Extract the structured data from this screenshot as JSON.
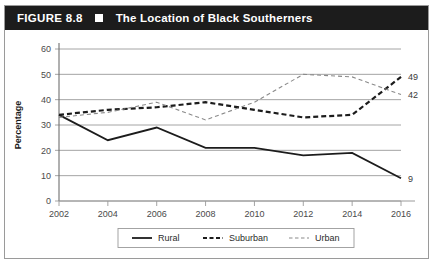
{
  "figure": {
    "number": "FIGURE 8.8",
    "bullet": "square-marker",
    "title": "The Location of Black Southerners"
  },
  "chart_data": {
    "type": "line",
    "title": "The Location of Black Southerners",
    "xlabel": "",
    "ylabel": "Percentage",
    "x": [
      2002,
      2004,
      2006,
      2008,
      2010,
      2012,
      2014,
      2016
    ],
    "xtick_labels": [
      "2002",
      "2004",
      "2006",
      "2008",
      "2010",
      "2012",
      "2014",
      "2016"
    ],
    "ytick_labels": [
      "0",
      "10",
      "20",
      "30",
      "40",
      "50",
      "60"
    ],
    "yticks": [
      0,
      10,
      20,
      30,
      40,
      50,
      60
    ],
    "ylim": [
      0,
      60
    ],
    "xlim": [
      2002,
      2016
    ],
    "grid": "horizontal",
    "legend_position": "bottom",
    "series": [
      {
        "name": "Rural",
        "style": "solid",
        "color": "#1c1c1c",
        "values": [
          34,
          24,
          29,
          21,
          21,
          18,
          19,
          9
        ],
        "end_label": "9"
      },
      {
        "name": "Suburban",
        "style": "dashed-bold",
        "color": "#1c1c1c",
        "values": [
          34,
          36,
          37,
          39,
          36,
          33,
          34,
          49
        ],
        "end_label": "49"
      },
      {
        "name": "Urban",
        "style": "dashed-light",
        "color": "#8a8a8a",
        "values": [
          33,
          35,
          39,
          32,
          39,
          50,
          49,
          42
        ],
        "end_label": "42"
      }
    ],
    "annotations": [
      {
        "text": "49",
        "series": "Suburban",
        "x": 2016
      },
      {
        "text": "42",
        "series": "Urban",
        "x": 2016
      },
      {
        "text": "9",
        "series": "Rural",
        "x": 2016
      }
    ],
    "legend": [
      {
        "label": "Rural",
        "style": "solid"
      },
      {
        "label": "Suburban",
        "style": "dashed-bold"
      },
      {
        "label": "Urban",
        "style": "dashed-light"
      }
    ]
  },
  "colors": {
    "header_bg": "#1c1c1c",
    "header_fg": "#ffffff",
    "grid": "#9a9a9a",
    "rural": "#1c1c1c",
    "suburban": "#1c1c1c",
    "urban": "#8a8a8a",
    "border": "#9a9a9a"
  }
}
